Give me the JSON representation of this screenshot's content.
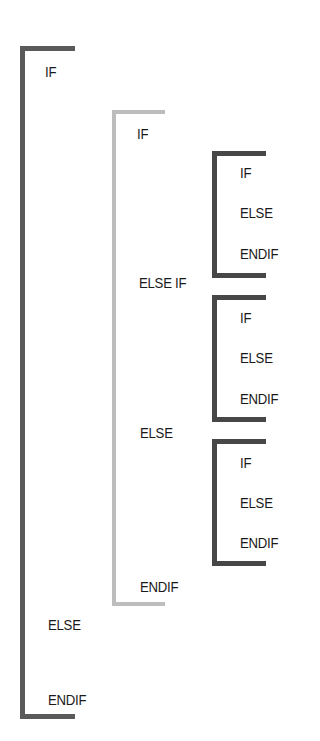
{
  "colors": {
    "outer": "#5a5a5a",
    "middle": "#bdbdbd",
    "inner": "#474747",
    "text": "#1a1a1a"
  },
  "outer_block": {
    "if_label": "IF",
    "else_label": "ELSE",
    "endif_label": "ENDIF"
  },
  "middle_block": {
    "if_label": "IF",
    "else_if_label": "ELSE IF",
    "else_label": "ELSE",
    "endif_label": "ENDIF"
  },
  "inner_blocks": [
    {
      "if_label": "IF",
      "else_label": "ELSE",
      "endif_label": "ENDIF"
    },
    {
      "if_label": "IF",
      "else_label": "ELSE",
      "endif_label": "ENDIF"
    },
    {
      "if_label": "IF",
      "else_label": "ELSE",
      "endif_label": "ENDIF"
    }
  ]
}
